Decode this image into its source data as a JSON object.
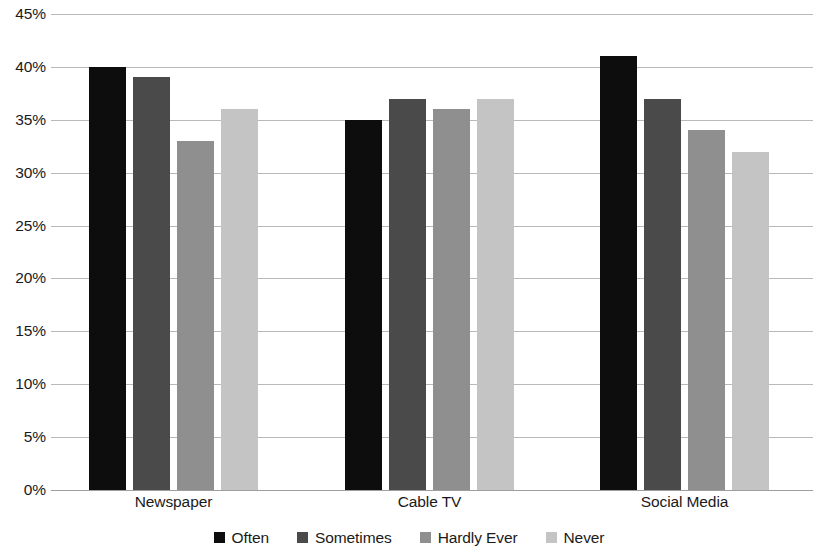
{
  "chart_data": {
    "type": "bar",
    "title": "",
    "subtitle": "",
    "xlabel": "",
    "ylabel": "",
    "categories": [
      "Newspaper",
      "Cable TV",
      "Social Media"
    ],
    "series": [
      {
        "name": "Often",
        "values": [
          40,
          35,
          41
        ],
        "color": "#0d0d0d"
      },
      {
        "name": "Sometimes",
        "values": [
          39,
          37,
          37
        ],
        "color": "#4a4a4a"
      },
      {
        "name": "Hardly Ever",
        "values": [
          33,
          36,
          34
        ],
        "color": "#8f8f8f"
      },
      {
        "name": "Never",
        "values": [
          36,
          37,
          32
        ],
        "color": "#c4c4c4"
      }
    ],
    "ylim": [
      0,
      45
    ],
    "ytick_values": [
      45,
      40,
      35,
      30,
      25,
      20,
      15,
      10,
      5,
      0
    ],
    "ytick_labels": [
      "45%",
      "40%",
      "35%",
      "30%",
      "25%",
      "20%",
      "15%",
      "10%",
      "5%",
      "0%"
    ],
    "grid": true,
    "grid_color": "#b9b9b9",
    "legend_position": "bottom",
    "background": "#ffffff"
  }
}
